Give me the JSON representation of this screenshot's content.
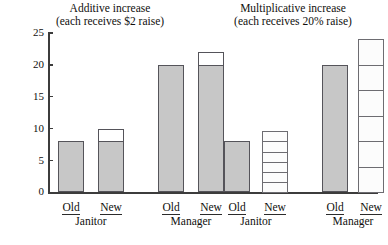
{
  "figure": {
    "axis": {
      "y_ticks": [
        0,
        5,
        10,
        15,
        20,
        25
      ],
      "ylim": [
        0,
        25
      ],
      "ylabel": "",
      "grid": false
    },
    "panels": [
      {
        "id": "additive",
        "title_line1": "Additive increase",
        "title_line2": "(each receives $2 raise)",
        "groups": [
          {
            "name": "Janitor",
            "bars": [
              {
                "label": "Old",
                "value": 8,
                "base": 8,
                "increase": 0,
                "style": "solid"
              },
              {
                "label": "New",
                "value": 10,
                "base": 8,
                "increase": 2,
                "style": "capped"
              }
            ]
          },
          {
            "name": "Manager",
            "bars": [
              {
                "label": "Old",
                "value": 20,
                "base": 20,
                "increase": 0,
                "style": "solid"
              },
              {
                "label": "New",
                "value": 22,
                "base": 20,
                "increase": 2,
                "style": "capped"
              }
            ]
          }
        ]
      },
      {
        "id": "multiplicative",
        "title_line1": "Multiplicative increase",
        "title_line2": "(each receives 20% raise)",
        "groups": [
          {
            "name": "Janitor",
            "bars": [
              {
                "label": "Old",
                "value": 8,
                "base": 8,
                "increase": 0,
                "style": "solid"
              },
              {
                "label": "New",
                "value": 9.6,
                "base": 8,
                "increase": 1.6,
                "style": "segmented",
                "segments": 6
              }
            ]
          },
          {
            "name": "Manager",
            "bars": [
              {
                "label": "Old",
                "value": 20,
                "base": 20,
                "increase": 0,
                "style": "solid"
              },
              {
                "label": "New",
                "value": 24,
                "base": 20,
                "increase": 4,
                "style": "segmented",
                "segments": 6
              }
            ]
          }
        ]
      }
    ]
  },
  "chart_data": {
    "type": "bar",
    "xlabel": "",
    "ylabel": "",
    "ylim": [
      0,
      25
    ],
    "yticks": [
      0,
      5,
      10,
      15,
      20,
      25
    ],
    "grid": false,
    "legend": "none",
    "panels": [
      {
        "title": "Additive increase (each receives $2 raise)",
        "categories": [
          "Janitor Old",
          "Janitor New",
          "Manager Old",
          "Manager New"
        ],
        "values": [
          8,
          10,
          20,
          22
        ],
        "fill": [
          "gray",
          "gray-with-white-cap",
          "gray",
          "gray-with-white-cap"
        ]
      },
      {
        "title": "Multiplicative increase (each receives 20% raise)",
        "categories": [
          "Janitor Old",
          "Janitor New",
          "Manager Old",
          "Manager New"
        ],
        "values": [
          8,
          9.6,
          20,
          24
        ],
        "fill": [
          "gray",
          "white-segmented",
          "gray",
          "white-segmented"
        ]
      }
    ]
  }
}
